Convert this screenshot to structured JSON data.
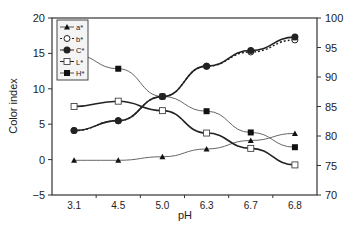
{
  "chart_data": {
    "type": "line",
    "title": "",
    "xlabel": "pH",
    "ylabel": "Color index",
    "y2label": "",
    "categories": [
      "3.1",
      "4.5",
      "5.0",
      "6.3",
      "6.7",
      "6.8"
    ],
    "ylim": [
      -5,
      20
    ],
    "yticks": [
      "-5",
      "0",
      "5",
      "10",
      "15",
      "20"
    ],
    "y2lim": [
      70,
      100
    ],
    "y2ticks": [
      "70",
      "75",
      "80",
      "85",
      "90",
      "95",
      "100"
    ],
    "grid": false,
    "legend_position": "upper-left",
    "series": [
      {
        "name": "a*",
        "axis": "left",
        "marker": "triangle-filled",
        "line": "solid-thin",
        "values": [
          -0.1,
          -0.1,
          0.4,
          1.5,
          2.7,
          3.7
        ]
      },
      {
        "name": "b*",
        "axis": "left",
        "marker": "circle-open",
        "line": "dotted",
        "values": [
          4.1,
          5.5,
          8.9,
          13.2,
          15.2,
          16.9
        ]
      },
      {
        "name": "C*",
        "axis": "left",
        "marker": "circle-filled",
        "line": "solid-thick",
        "values": [
          4.1,
          5.5,
          8.9,
          13.2,
          15.4,
          17.3
        ]
      },
      {
        "name": "L*",
        "axis": "right",
        "marker": "square-open",
        "line": "solid-thick",
        "values": [
          85.0,
          85.9,
          84.3,
          80.5,
          77.9,
          75.1
        ]
      },
      {
        "name": "H*",
        "axis": "right",
        "marker": "square-filled",
        "line": "solid-thin",
        "values": [
          93.8,
          91.4,
          86.7,
          84.2,
          80.6,
          78.1
        ]
      }
    ]
  }
}
